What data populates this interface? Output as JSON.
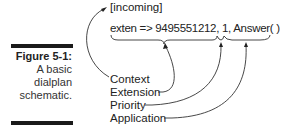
{
  "figure": {
    "label": "Figure 5-1:",
    "caption_lines": [
      "A basic",
      "dialplan",
      "schematic."
    ]
  },
  "diagram": {
    "context_line": "[incoming]",
    "code_line": "exten => 9495551212, 1, Answer( )",
    "labels": [
      "Context",
      "Extension",
      "Priority",
      "Application"
    ]
  }
}
